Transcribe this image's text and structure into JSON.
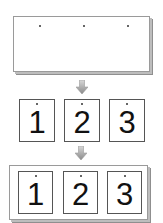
{
  "diagram": {
    "stage1": {
      "description": "single wide sheet with three punch marks",
      "marks": 3
    },
    "arrows": [
      {
        "icon": "down-arrow-icon",
        "direction": "down"
      },
      {
        "icon": "down-arrow-icon",
        "direction": "down"
      }
    ],
    "stage2": {
      "description": "sheet split into three separate pages",
      "pages": [
        {
          "label": "1"
        },
        {
          "label": "2"
        },
        {
          "label": "3"
        }
      ]
    },
    "stage3": {
      "description": "three pages arranged on one sheet",
      "pages": [
        {
          "label": "1"
        },
        {
          "label": "2"
        },
        {
          "label": "3"
        }
      ]
    },
    "colors": {
      "border": "#555555",
      "shadow": "#8f8f8f",
      "arrow_light": "#d8d8d8",
      "arrow_dark": "#8a8a8a"
    }
  }
}
